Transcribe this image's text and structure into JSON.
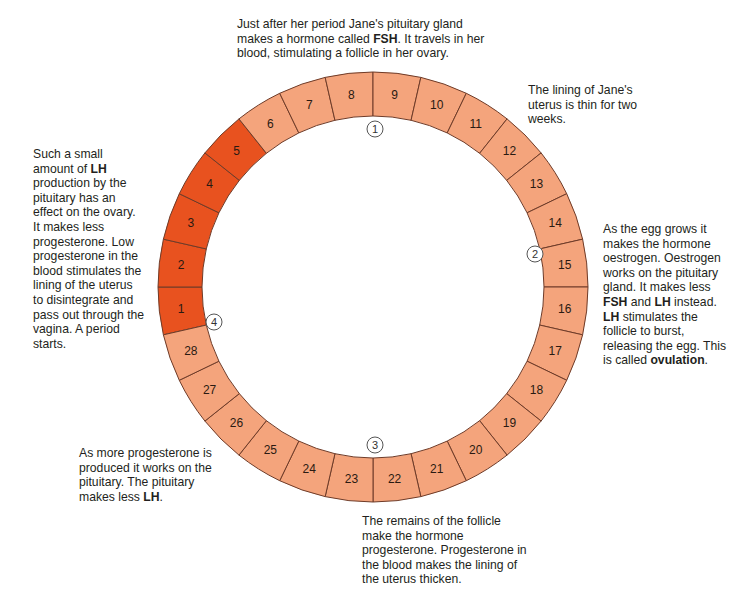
{
  "diagram": {
    "center": {
      "x": 373,
      "y": 287
    },
    "outer_radius": 215,
    "inner_radius": 171,
    "colors": {
      "period": "#e8521f",
      "normal": "#f4a47c",
      "border": "#6e3b28",
      "marker_stroke": "#555555"
    },
    "days": [
      {
        "day": "1",
        "phase": "period"
      },
      {
        "day": "2",
        "phase": "period"
      },
      {
        "day": "3",
        "phase": "period"
      },
      {
        "day": "4",
        "phase": "period"
      },
      {
        "day": "5",
        "phase": "period"
      },
      {
        "day": "6",
        "phase": "normal"
      },
      {
        "day": "7",
        "phase": "normal"
      },
      {
        "day": "8",
        "phase": "normal"
      },
      {
        "day": "9",
        "phase": "normal"
      },
      {
        "day": "10",
        "phase": "normal"
      },
      {
        "day": "11",
        "phase": "normal"
      },
      {
        "day": "12",
        "phase": "normal"
      },
      {
        "day": "13",
        "phase": "normal"
      },
      {
        "day": "14",
        "phase": "normal"
      },
      {
        "day": "15",
        "phase": "normal"
      },
      {
        "day": "16",
        "phase": "normal"
      },
      {
        "day": "17",
        "phase": "normal"
      },
      {
        "day": "18",
        "phase": "normal"
      },
      {
        "day": "19",
        "phase": "normal"
      },
      {
        "day": "20",
        "phase": "normal"
      },
      {
        "day": "21",
        "phase": "normal"
      },
      {
        "day": "22",
        "phase": "normal"
      },
      {
        "day": "23",
        "phase": "normal"
      },
      {
        "day": "24",
        "phase": "normal"
      },
      {
        "day": "25",
        "phase": "normal"
      },
      {
        "day": "26",
        "phase": "normal"
      },
      {
        "day": "27",
        "phase": "normal"
      },
      {
        "day": "28",
        "phase": "normal"
      }
    ],
    "markers": [
      {
        "label": "1",
        "x": 375,
        "y": 129
      },
      {
        "label": "2",
        "x": 535,
        "y": 254
      },
      {
        "label": "3",
        "x": 375,
        "y": 445
      },
      {
        "label": "4",
        "x": 214,
        "y": 322
      }
    ]
  },
  "notes": {
    "top": {
      "x": 237,
      "y": 17,
      "width": 260,
      "parts": [
        {
          "t": "Just after her period Jane's pituitary gland makes a hormone called "
        },
        {
          "t": "FSH",
          "b": true
        },
        {
          "t": ". It travels in her blood, stimulating a follicle in her ovary."
        }
      ]
    },
    "top_right": {
      "x": 528,
      "y": 83,
      "width": 125,
      "parts": [
        {
          "t": "The lining of Jane's uterus is thin for two weeks."
        }
      ]
    },
    "right": {
      "x": 603,
      "y": 222,
      "width": 126,
      "parts": [
        {
          "t": "As the egg grows it makes the hormone oestrogen. Oestrogen works on the pituitary gland. It makes less "
        },
        {
          "t": "FSH",
          "b": true
        },
        {
          "t": " and "
        },
        {
          "t": "LH",
          "b": true
        },
        {
          "t": " instead. "
        },
        {
          "t": "LH",
          "b": true
        },
        {
          "t": " stimulates the follicle to burst, releasing the egg. This is called "
        },
        {
          "t": "ovulation",
          "b": true
        },
        {
          "t": "."
        }
      ]
    },
    "left": {
      "x": 33,
      "y": 147,
      "width": 112,
      "parts": [
        {
          "t": "Such a small amount of "
        },
        {
          "t": "LH",
          "b": true
        },
        {
          "t": " production by the pituitary has an effect on the ovary. It makes less progesterone. Low progesterone in the blood stimulates the lining of the uterus to disintegrate and pass out through the vagina. A period starts."
        }
      ]
    },
    "bottom_left": {
      "x": 79,
      "y": 446,
      "width": 142,
      "parts": [
        {
          "t": "As more progesterone is produced it works on the pituitary. The pituitary makes less "
        },
        {
          "t": "LH",
          "b": true
        },
        {
          "t": "."
        }
      ]
    },
    "bottom": {
      "x": 362,
      "y": 514,
      "width": 170,
      "parts": [
        {
          "t": "The remains of the follicle make the hormone progesterone. Progesterone in the blood makes the lining of the uterus thicken."
        }
      ]
    }
  }
}
